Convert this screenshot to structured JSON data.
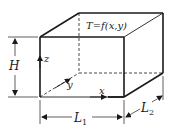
{
  "diagram": {
    "title_equation": "T=f(x,y)",
    "labels": {
      "height": "H",
      "length1": "L",
      "length1_sub": "1",
      "length2": "L",
      "length2_sub": "2",
      "axis_x": "x",
      "axis_y": "y",
      "axis_z": "z"
    },
    "colors": {
      "stroke": "#1a1a1a",
      "background": "#ffffff"
    }
  }
}
